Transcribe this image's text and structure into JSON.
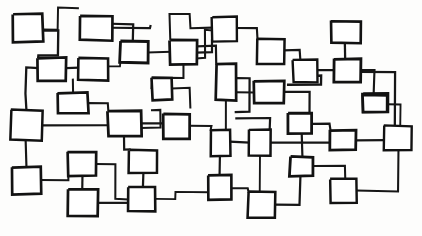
{
  "document": {
    "title": "Hand-drawn block diagram",
    "kind": "sketch",
    "description": "A dense hand-sketched network of rectangular nodes connected by orthogonal lines, drawn in black ink on white paper.",
    "canvas": {
      "width": 422,
      "height": 236
    },
    "palette": {
      "background": "#fdfdfc",
      "ink": "#161616",
      "node_fill": "#ffffff",
      "node_stroke": "#121212"
    },
    "style": {
      "stroke_width_node": 2.6,
      "stroke_width_edge": 2.1,
      "hand_drawn": true
    },
    "counts": {
      "nodes": 41,
      "edges": 52
    }
  },
  "diagram": {
    "nodes": [
      {
        "id": "n1",
        "name": "node-1",
        "x": 13,
        "y": 14,
        "w": 30,
        "h": 28,
        "rot": -1.2
      },
      {
        "id": "n2",
        "name": "node-2",
        "x": 80,
        "y": 16,
        "w": 32,
        "h": 24,
        "rot": 0.8
      },
      {
        "id": "n3",
        "name": "node-3",
        "x": 212,
        "y": 17,
        "w": 25,
        "h": 24,
        "rot": -0.6
      },
      {
        "id": "n4",
        "name": "node-4",
        "x": 331,
        "y": 21,
        "w": 30,
        "h": 22,
        "rot": 0.5
      },
      {
        "id": "n5",
        "name": "node-5",
        "x": 120,
        "y": 41,
        "w": 28,
        "h": 22,
        "rot": 1.0
      },
      {
        "id": "n6",
        "name": "node-6",
        "x": 170,
        "y": 40,
        "w": 27,
        "h": 24,
        "rot": -0.8
      },
      {
        "id": "n7",
        "name": "node-7",
        "x": 257,
        "y": 39,
        "w": 27,
        "h": 25,
        "rot": 0.6
      },
      {
        "id": "n8",
        "name": "node-8",
        "x": 38,
        "y": 58,
        "w": 28,
        "h": 23,
        "rot": -0.5
      },
      {
        "id": "n9",
        "name": "node-9",
        "x": 78,
        "y": 58,
        "w": 30,
        "h": 22,
        "rot": 0.9
      },
      {
        "id": "n10",
        "name": "node-10",
        "x": 293,
        "y": 60,
        "w": 24,
        "h": 22,
        "rot": -0.7
      },
      {
        "id": "n11",
        "name": "node-11",
        "x": 334,
        "y": 59,
        "w": 27,
        "h": 23,
        "rot": 0.4
      },
      {
        "id": "n12",
        "name": "node-12",
        "x": 152,
        "y": 78,
        "w": 20,
        "h": 22,
        "rot": -0.9
      },
      {
        "id": "n13",
        "name": "node-13",
        "x": 216,
        "y": 64,
        "w": 20,
        "h": 36,
        "rot": 0.7
      },
      {
        "id": "n14",
        "name": "node-14",
        "x": 58,
        "y": 93,
        "w": 30,
        "h": 20,
        "rot": -0.6
      },
      {
        "id": "n15",
        "name": "node-15",
        "x": 254,
        "y": 81,
        "w": 30,
        "h": 22,
        "rot": 0.5
      },
      {
        "id": "n16",
        "name": "node-16",
        "x": 363,
        "y": 93,
        "w": 25,
        "h": 19,
        "rot": -0.4
      },
      {
        "id": "n17",
        "name": "node-17",
        "x": 11,
        "y": 110,
        "w": 31,
        "h": 30,
        "rot": 0.8
      },
      {
        "id": "n18",
        "name": "node-18",
        "x": 108,
        "y": 111,
        "w": 33,
        "h": 25,
        "rot": -0.7
      },
      {
        "id": "n19",
        "name": "node-19",
        "x": 163,
        "y": 114,
        "w": 27,
        "h": 25,
        "rot": 0.6
      },
      {
        "id": "n20",
        "name": "node-20",
        "x": 288,
        "y": 113,
        "w": 24,
        "h": 21,
        "rot": -0.5
      },
      {
        "id": "n21",
        "name": "node-21",
        "x": 363,
        "y": 95,
        "w": 24,
        "h": 17,
        "rot": 0.3
      },
      {
        "id": "n22",
        "name": "node-22",
        "x": 211,
        "y": 130,
        "w": 19,
        "h": 26,
        "rot": -0.8
      },
      {
        "id": "n23",
        "name": "node-23",
        "x": 249,
        "y": 130,
        "w": 22,
        "h": 26,
        "rot": 0.6
      },
      {
        "id": "n24",
        "name": "node-24",
        "x": 330,
        "y": 130,
        "w": 26,
        "h": 20,
        "rot": -0.5
      },
      {
        "id": "n25",
        "name": "node-25",
        "x": 384,
        "y": 126,
        "w": 28,
        "h": 24,
        "rot": 0.7
      },
      {
        "id": "n26",
        "name": "node-26",
        "x": 68,
        "y": 152,
        "w": 28,
        "h": 24,
        "rot": -0.6
      },
      {
        "id": "n27",
        "name": "node-27",
        "x": 129,
        "y": 150,
        "w": 28,
        "h": 23,
        "rot": 0.5
      },
      {
        "id": "n28",
        "name": "node-28",
        "x": 12,
        "y": 167,
        "w": 29,
        "h": 27,
        "rot": -0.7
      },
      {
        "id": "n29",
        "name": "node-29",
        "x": 290,
        "y": 157,
        "w": 23,
        "h": 19,
        "rot": 0.6
      },
      {
        "id": "n30",
        "name": "node-30",
        "x": 208,
        "y": 175,
        "w": 23,
        "h": 25,
        "rot": -0.5
      },
      {
        "id": "n31",
        "name": "node-31",
        "x": 128,
        "y": 187,
        "w": 27,
        "h": 24,
        "rot": 0.8
      },
      {
        "id": "n32",
        "name": "node-32",
        "x": 68,
        "y": 189,
        "w": 30,
        "h": 27,
        "rot": -0.6
      },
      {
        "id": "n33",
        "name": "node-33",
        "x": 248,
        "y": 192,
        "w": 27,
        "h": 26,
        "rot": 0.5
      },
      {
        "id": "n34",
        "name": "node-34",
        "x": 330,
        "y": 179,
        "w": 27,
        "h": 24,
        "rot": -0.7
      },
      {
        "id": "n35",
        "name": "node-35",
        "x": 189,
        "y": 108,
        "w": 0,
        "h": 0,
        "rot": 0
      },
      {
        "id": "n36",
        "name": "node-36",
        "x": 321,
        "y": 85,
        "w": 0,
        "h": 0,
        "rot": 0
      },
      {
        "id": "n37",
        "name": "node-37",
        "x": 160,
        "y": 110,
        "w": 0,
        "h": 0,
        "rot": 0
      },
      {
        "id": "n38",
        "name": "node-38",
        "x": 296,
        "y": 56,
        "w": 0,
        "h": 0,
        "rot": 0
      },
      {
        "id": "n39",
        "name": "node-39",
        "x": 362,
        "y": 110,
        "w": 0,
        "h": 0,
        "rot": 0
      },
      {
        "id": "n40",
        "name": "node-40",
        "x": 100,
        "y": 180,
        "w": 0,
        "h": 0,
        "rot": 0
      },
      {
        "id": "n41",
        "name": "node-41",
        "x": 250,
        "y": 112,
        "w": 0,
        "h": 0,
        "rot": 0
      }
    ],
    "edges": [
      {
        "id": "e1",
        "name": "edge-1",
        "points": "43,30 58,30 58,8 78,8"
      },
      {
        "id": "e2",
        "name": "edge-2",
        "points": "43,30 58,30 58,55 38,55 38,58"
      },
      {
        "id": "e3",
        "name": "edge-3",
        "points": "112,24 133,24 133,41"
      },
      {
        "id": "e4",
        "name": "edge-4",
        "points": "112,28 150,28 150,26"
      },
      {
        "id": "e5",
        "name": "edge-5",
        "points": "197,52 212,52 212,41"
      },
      {
        "id": "e6",
        "name": "edge-6",
        "points": "183,64 183,78 152,78 152,88"
      },
      {
        "id": "e7",
        "name": "edge-7",
        "points": "197,46 216,46 216,64"
      },
      {
        "id": "e8",
        "name": "edge-8",
        "points": "148,52 170,52"
      },
      {
        "id": "e9",
        "name": "edge-9",
        "points": "237,28 257,28 257,39"
      },
      {
        "id": "e10",
        "name": "edge-10",
        "points": "212,28 190,28 190,14 170,14 170,40"
      },
      {
        "id": "e11",
        "name": "edge-11",
        "points": "284,50 300,50 300,60"
      },
      {
        "id": "e12",
        "name": "edge-12",
        "points": "345,43 345,59"
      },
      {
        "id": "e13",
        "name": "edge-13",
        "points": "317,70 334,70"
      },
      {
        "id": "e14",
        "name": "edge-14",
        "points": "361,70 374,70 374,93"
      },
      {
        "id": "e15",
        "name": "edge-15",
        "points": "66,68 78,68"
      },
      {
        "id": "e16",
        "name": "edge-16",
        "points": "38,68 26,68 26,93 26,110"
      },
      {
        "id": "e17",
        "name": "edge-17",
        "points": "108,66 120,66 120,63"
      },
      {
        "id": "e18",
        "name": "edge-18",
        "points": "73,80 73,93"
      },
      {
        "id": "e19",
        "name": "edge-19",
        "points": "88,103 108,103 108,111"
      },
      {
        "id": "e20",
        "name": "edge-20",
        "points": "172,88 190,88 190,108"
      },
      {
        "id": "e21",
        "name": "edge-21",
        "points": "141,123 163,123"
      },
      {
        "id": "e22",
        "name": "edge-22",
        "points": "42,125 108,125"
      },
      {
        "id": "e23",
        "name": "edge-23",
        "points": "26,140 26,167"
      },
      {
        "id": "e24",
        "name": "edge-24",
        "points": "124,136 124,150 129,150"
      },
      {
        "id": "e25",
        "name": "edge-25",
        "points": "41,180 68,180 68,164"
      },
      {
        "id": "e26",
        "name": "edge-26",
        "points": "82,176 82,189"
      },
      {
        "id": "e27",
        "name": "edge-27",
        "points": "96,164 115,164 115,199 128,199"
      },
      {
        "id": "e28",
        "name": "edge-28",
        "points": "143,173 143,187"
      },
      {
        "id": "e29",
        "name": "edge-29",
        "points": "98,203 128,203"
      },
      {
        "id": "e30",
        "name": "edge-30",
        "points": "155,199 175,199 175,192 208,192"
      },
      {
        "id": "e31",
        "name": "edge-31",
        "points": "190,126 211,126 211,130"
      },
      {
        "id": "e32",
        "name": "edge-32",
        "points": "230,142 249,142"
      },
      {
        "id": "e33",
        "name": "edge-33",
        "points": "220,156 220,175"
      },
      {
        "id": "e34",
        "name": "edge-34",
        "points": "226,100 226,130"
      },
      {
        "id": "e35",
        "name": "edge-35",
        "points": "236,92 254,92"
      },
      {
        "id": "e36",
        "name": "edge-36",
        "points": "236,118 270,118 270,130"
      },
      {
        "id": "e37",
        "name": "edge-37",
        "points": "284,92 310,92 310,113"
      },
      {
        "id": "e38",
        "name": "edge-38",
        "points": "231,188 248,188 248,192"
      },
      {
        "id": "e39",
        "name": "edge-39",
        "points": "260,156 260,192"
      },
      {
        "id": "e40",
        "name": "edge-40",
        "points": "271,143 330,143"
      },
      {
        "id": "e41",
        "name": "edge-41",
        "points": "312,124 330,124 330,130"
      },
      {
        "id": "e42",
        "name": "edge-42",
        "points": "302,134 302,157"
      },
      {
        "id": "e43",
        "name": "edge-43",
        "points": "313,166 345,166 345,179"
      },
      {
        "id": "e44",
        "name": "edge-44",
        "points": "356,140 384,140"
      },
      {
        "id": "e45",
        "name": "edge-45",
        "points": "388,104 400,104 400,126"
      },
      {
        "id": "e46",
        "name": "edge-46",
        "points": "361,72 395,72 395,126"
      },
      {
        "id": "e47",
        "name": "edge-47",
        "points": "357,191 398,191 398,150"
      },
      {
        "id": "e48",
        "name": "edge-48",
        "points": "275,205 300,205 300,176"
      },
      {
        "id": "e49",
        "name": "edge-49",
        "points": "236,78 250,78 250,112 236,112"
      },
      {
        "id": "e50",
        "name": "edge-50",
        "points": "317,76 321,76 321,85 288,85"
      },
      {
        "id": "e51",
        "name": "edge-51",
        "points": "141,128 160,128 160,110 152,110"
      },
      {
        "id": "e52",
        "name": "edge-52",
        "points": "197,58 205,58 205,30 212,30"
      }
    ]
  }
}
